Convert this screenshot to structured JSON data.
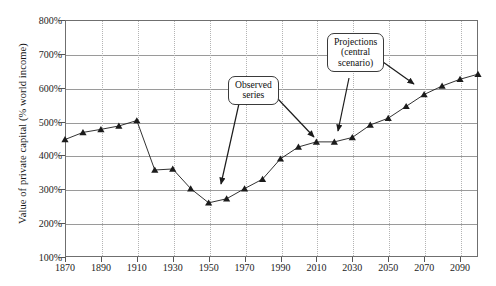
{
  "chart_data": {
    "type": "line",
    "title": "",
    "xlabel": "",
    "ylabel": "Value of private capital (% world income)",
    "xlim": [
      1870,
      2100
    ],
    "ylim": [
      100,
      800
    ],
    "ytick_labels": [
      "800%",
      "700%",
      "600%",
      "500%",
      "400%",
      "300%",
      "200%",
      "100%"
    ],
    "ytick_values": [
      800,
      700,
      600,
      500,
      400,
      300,
      200,
      100
    ],
    "xtick_labels": [
      "1870",
      "1890",
      "1910",
      "1930",
      "1950",
      "1970",
      "1990",
      "2010",
      "2030",
      "2050",
      "2070",
      "2090"
    ],
    "xtick_values": [
      1870,
      1890,
      1910,
      1930,
      1950,
      1970,
      1990,
      2010,
      2030,
      2050,
      2070,
      2090
    ],
    "grid": "horizontal-solid-and-vertical-dotted",
    "legend": "none",
    "marker": "triangle",
    "line_color": "#1b1b1b",
    "x": [
      1870,
      1880,
      1890,
      1900,
      1910,
      1920,
      1930,
      1940,
      1950,
      1960,
      1970,
      1980,
      1990,
      2000,
      2010,
      2020,
      2030,
      2040,
      2050,
      2060,
      2070,
      2080,
      2090,
      2100
    ],
    "values": [
      447,
      468,
      477,
      487,
      503,
      357,
      360,
      302,
      260,
      272,
      302,
      330,
      390,
      425,
      440,
      440,
      453,
      490,
      510,
      545,
      580,
      605,
      625,
      640
    ],
    "series": [
      {
        "name": "Value of private capital (% world income)",
        "values": [
          447,
          468,
          477,
          487,
          503,
          357,
          360,
          302,
          260,
          272,
          302,
          330,
          390,
          425,
          440,
          440,
          453,
          490,
          510,
          545,
          580,
          605,
          625,
          640
        ]
      }
    ],
    "annotations": [
      {
        "id": "observed-series",
        "lines": [
          "Observed",
          "series"
        ],
        "text": "Observed series",
        "points_to": [
          [
            1962,
            318
          ],
          [
            2012,
            437
          ]
        ]
      },
      {
        "id": "projections-central-scenario",
        "lines": [
          "Projections",
          "(central",
          "scenario)"
        ],
        "text": "Projections (central scenario)",
        "points_to": [
          [
            2022,
            443
          ],
          [
            2046,
            498
          ]
        ]
      }
    ]
  },
  "axis": {
    "y_title": "Value of private capital (% world income)",
    "y_ticks": [
      "800%",
      "700%",
      "600%",
      "500%",
      "400%",
      "300%",
      "200%",
      "100%"
    ],
    "x_ticks": [
      "1870",
      "1890",
      "1910",
      "1930",
      "1950",
      "1970",
      "1990",
      "2010",
      "2030",
      "2050",
      "2070",
      "2090"
    ]
  },
  "callouts": {
    "observed": {
      "line1": "Observed",
      "line2": "series"
    },
    "projections": {
      "line1": "Projections",
      "line2": "(central",
      "line3": "scenario)"
    }
  }
}
